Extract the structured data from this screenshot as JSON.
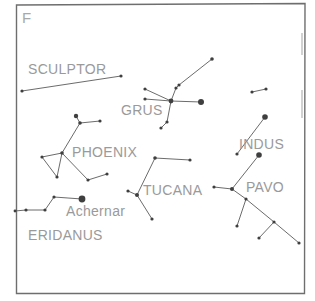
{
  "plate": {
    "letter": "F"
  },
  "colors": {
    "frame": "#6e6e6e",
    "lines": "#5a5a5a",
    "stars": "#3f3f3f",
    "labels": "#9a9a9a"
  },
  "labels": {
    "sculptor": "SCULPTOR",
    "grus": "GRUS",
    "phoenix": "PHOENIX",
    "indus": "INDUS",
    "tucana": "TUCANA",
    "pavo": "PAVO",
    "achernar": "Achernar",
    "eridanus": "ERIDANUS"
  },
  "constellations": [
    {
      "name": "SCULPTOR",
      "stars": [
        [
          22,
          91,
          1.6
        ],
        [
          121,
          76,
          1.6
        ]
      ],
      "lines": [
        [
          0,
          1
        ]
      ]
    },
    {
      "name": "GRUS",
      "stars": [
        [
          145,
          89,
          1.6
        ],
        [
          145,
          99,
          1.6
        ],
        [
          171,
          101,
          2.4
        ],
        [
          176,
          88,
          1.6
        ],
        [
          179,
          85,
          1.6
        ],
        [
          212,
          59,
          1.8
        ],
        [
          201,
          102,
          3.0
        ],
        [
          167,
          122,
          1.6
        ],
        [
          161,
          128,
          1.6
        ]
      ],
      "lines": [
        [
          0,
          2
        ],
        [
          1,
          2
        ],
        [
          2,
          3
        ],
        [
          3,
          4
        ],
        [
          4,
          5
        ],
        [
          2,
          6
        ],
        [
          2,
          7
        ],
        [
          7,
          8
        ]
      ]
    },
    {
      "name": "PHOENIX",
      "stars": [
        [
          76,
          116,
          2.2
        ],
        [
          80,
          123,
          1.8
        ],
        [
          100,
          121,
          1.6
        ],
        [
          62,
          153,
          1.8
        ],
        [
          42,
          157,
          1.6
        ],
        [
          57,
          177,
          1.6
        ],
        [
          88,
          180,
          1.6
        ],
        [
          107,
          174,
          1.6
        ]
      ],
      "lines": [
        [
          0,
          1
        ],
        [
          1,
          2
        ],
        [
          1,
          3
        ],
        [
          3,
          4
        ],
        [
          4,
          5
        ],
        [
          5,
          3
        ],
        [
          3,
          6
        ],
        [
          6,
          7
        ]
      ]
    },
    {
      "name": "ERIDANUS",
      "stars": [
        [
          15,
          211,
          1.4
        ],
        [
          26,
          210,
          1.6
        ],
        [
          45,
          210,
          1.6
        ],
        [
          54,
          197,
          1.6
        ],
        [
          82,
          199,
          3.4
        ]
      ],
      "lines": [
        [
          0,
          1
        ],
        [
          1,
          2
        ],
        [
          2,
          3
        ],
        [
          3,
          4
        ]
      ]
    },
    {
      "name": "TUCANA",
      "stars": [
        [
          155,
          158,
          1.8
        ],
        [
          190,
          160,
          1.6
        ],
        [
          128,
          191,
          1.6
        ],
        [
          137,
          195,
          2.0
        ],
        [
          152,
          219,
          1.6
        ]
      ],
      "lines": [
        [
          0,
          1
        ],
        [
          0,
          3
        ],
        [
          2,
          3
        ],
        [
          3,
          4
        ]
      ]
    },
    {
      "name": "INDUS",
      "stars": [
        [
          252,
          92,
          1.6
        ],
        [
          266,
          89,
          1.6
        ],
        [
          265,
          117,
          2.8
        ],
        [
          237,
          154,
          1.6
        ]
      ],
      "lines": [
        [
          0,
          1
        ],
        [
          2,
          3
        ]
      ]
    },
    {
      "name": "PAVO",
      "stars": [
        [
          214,
          187,
          1.6
        ],
        [
          232,
          189,
          2.0
        ],
        [
          259,
          155,
          2.8
        ],
        [
          246,
          199,
          1.6
        ],
        [
          237,
          226,
          1.6
        ],
        [
          274,
          222,
          1.6
        ],
        [
          259,
          238,
          1.6
        ],
        [
          299,
          243,
          1.6
        ]
      ],
      "lines": [
        [
          0,
          1
        ],
        [
          1,
          2
        ],
        [
          1,
          3
        ],
        [
          3,
          4
        ],
        [
          3,
          5
        ],
        [
          5,
          6
        ],
        [
          5,
          7
        ]
      ]
    }
  ],
  "label_positions": {
    "plate": [
      22,
      23
    ],
    "sculptor": [
      28,
      74
    ],
    "grus": [
      121,
      115
    ],
    "phoenix": [
      72,
      157
    ],
    "indus": [
      239,
      149
    ],
    "tucana": [
      143,
      195
    ],
    "pavo": [
      246,
      192
    ],
    "achernar": [
      66,
      216
    ],
    "eridanus": [
      28,
      240
    ]
  }
}
